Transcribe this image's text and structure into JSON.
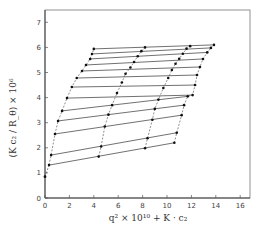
{
  "chart_data": {
    "type": "scatter",
    "subtype": "zimm-plot",
    "title": "",
    "xlabel": "q² × 10¹⁰ + K · c₂",
    "ylabel": "(K c₂ / R_θ) × 10⁶",
    "xlim": [
      0,
      17
    ],
    "ylim": [
      0,
      7.3
    ],
    "x_ticks": [
      "0",
      "2",
      "4",
      "6",
      "8",
      "10",
      "12",
      "14",
      "16"
    ],
    "y_ticks": [
      "0",
      "1",
      "2",
      "3",
      "4",
      "5",
      "6",
      "7"
    ],
    "grid": false,
    "legend": null,
    "colors": {
      "ink": "#222222",
      "axis": "#555555",
      "background": "#ffffff"
    },
    "angle_lines": [
      {
        "y_left": 1.31,
        "points": [
          [
            0.33,
            1.31
          ],
          [
            4.4,
            1.65
          ],
          [
            8.2,
            1.98
          ],
          [
            10.6,
            2.2
          ]
        ]
      },
      {
        "y_left": 1.71,
        "points": [
          [
            0.5,
            1.71
          ],
          [
            4.6,
            2.05
          ],
          [
            8.4,
            2.38
          ],
          [
            10.8,
            2.6
          ]
        ]
      },
      {
        "y_left": 2.55,
        "points": [
          [
            0.82,
            2.55
          ],
          [
            4.9,
            2.85
          ],
          [
            8.8,
            3.12
          ],
          [
            11.2,
            3.3
          ]
        ]
      },
      {
        "y_left": 3.07,
        "points": [
          [
            1.07,
            3.07
          ],
          [
            5.2,
            3.32
          ],
          [
            9.0,
            3.55
          ],
          [
            11.4,
            3.7
          ]
        ]
      },
      {
        "y_left": 3.47,
        "points": [
          [
            1.4,
            3.47
          ],
          [
            5.5,
            3.7
          ],
          [
            9.3,
            3.92
          ],
          [
            11.7,
            4.05
          ]
        ]
      },
      {
        "y_left": 3.98,
        "points": [
          [
            1.8,
            3.98
          ],
          [
            5.9,
            4.18
          ],
          [
            9.7,
            4.38
          ],
          [
            12.1,
            4.1
          ]
        ]
      },
      {
        "y_left": 4.42,
        "points": [
          [
            2.2,
            4.42
          ],
          [
            6.3,
            4.6
          ],
          [
            10.1,
            4.78
          ],
          [
            12.3,
            4.5
          ]
        ]
      },
      {
        "y_left": 4.78,
        "points": [
          [
            2.6,
            4.78
          ],
          [
            6.6,
            4.95
          ],
          [
            10.4,
            5.1
          ],
          [
            12.46,
            4.9
          ]
        ]
      },
      {
        "y_left": 5.06,
        "points": [
          [
            3.03,
            5.06
          ],
          [
            7.0,
            5.2
          ],
          [
            10.7,
            5.35
          ],
          [
            12.7,
            5.22
          ]
        ]
      },
      {
        "y_left": 5.3,
        "points": [
          [
            3.36,
            5.3
          ],
          [
            7.3,
            5.42
          ],
          [
            11.0,
            5.55
          ],
          [
            12.95,
            5.54
          ]
        ]
      },
      {
        "y_left": 5.54,
        "points": [
          [
            3.7,
            5.54
          ],
          [
            7.6,
            5.65
          ],
          [
            11.3,
            5.75
          ],
          [
            13.3,
            5.8
          ]
        ]
      },
      {
        "y_left": 5.74,
        "points": [
          [
            3.85,
            5.74
          ],
          [
            7.9,
            5.85
          ],
          [
            11.6,
            5.95
          ],
          [
            13.6,
            5.98
          ]
        ]
      },
      {
        "y_left": 5.94,
        "points": [
          [
            4.0,
            5.94
          ],
          [
            8.2,
            6.0
          ],
          [
            11.9,
            6.05
          ],
          [
            13.85,
            6.1
          ]
        ]
      }
    ],
    "extrapolated_points": [
      [
        0.0,
        0.85
      ]
    ],
    "annotations": []
  }
}
